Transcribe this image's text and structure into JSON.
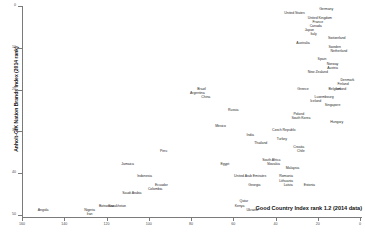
{
  "chart_data": {
    "type": "scatter",
    "title": "",
    "xlabel": "Good Country Index rank 1.2 (2014 data)",
    "ylabel": "Anholt-GfK Nation Brands Index (2014 rank)",
    "xlim": [
      160,
      0
    ],
    "ylim": [
      0,
      50
    ],
    "x_reversed": true,
    "y_reversed": true,
    "grid": false,
    "legend": "none",
    "xticks": [
      160,
      140,
      120,
      100,
      80,
      60,
      40,
      20,
      0
    ],
    "yticks": [
      0,
      10,
      20,
      30,
      40,
      50
    ],
    "point_style": "text-label-only",
    "points": [
      {
        "label": "Germany",
        "x": 16,
        "y": 1
      },
      {
        "label": "United States",
        "x": 31,
        "y": 2
      },
      {
        "label": "United Kingdom",
        "x": 19,
        "y": 3
      },
      {
        "label": "France",
        "x": 20,
        "y": 4
      },
      {
        "label": "Canada",
        "x": 21,
        "y": 5
      },
      {
        "label": "Japan",
        "x": 24,
        "y": 6
      },
      {
        "label": "Italy",
        "x": 22,
        "y": 7
      },
      {
        "label": "Switzerland",
        "x": 11,
        "y": 8
      },
      {
        "label": "Australia",
        "x": 27,
        "y": 9
      },
      {
        "label": "Sweden",
        "x": 12,
        "y": 10
      },
      {
        "label": "Netherland",
        "x": 10,
        "y": 11
      },
      {
        "label": "Spain",
        "x": 18,
        "y": 13
      },
      {
        "label": "Norway",
        "x": 13,
        "y": 14
      },
      {
        "label": "Austria",
        "x": 13,
        "y": 15
      },
      {
        "label": "New Zealand",
        "x": 20,
        "y": 16
      },
      {
        "label": "Denmark",
        "x": 6,
        "y": 18
      },
      {
        "label": "Finland",
        "x": 8,
        "y": 19
      },
      {
        "label": "Belgium",
        "x": 12,
        "y": 20
      },
      {
        "label": "Ireland",
        "x": 9,
        "y": 20
      },
      {
        "label": "Greece",
        "x": 27,
        "y": 20
      },
      {
        "label": "Luxembourg",
        "x": 17,
        "y": 22
      },
      {
        "label": "Iceland",
        "x": 21,
        "y": 23
      },
      {
        "label": "Singapore",
        "x": 13,
        "y": 24
      },
      {
        "label": "Poland",
        "x": 29,
        "y": 26
      },
      {
        "label": "South Korea",
        "x": 28,
        "y": 27
      },
      {
        "label": "Hungary",
        "x": 11,
        "y": 28
      },
      {
        "label": "Czech Republic",
        "x": 36,
        "y": 30
      },
      {
        "label": "Turkey",
        "x": 37,
        "y": 32
      },
      {
        "label": "Croatia",
        "x": 29,
        "y": 34
      },
      {
        "label": "Chile",
        "x": 28,
        "y": 35
      },
      {
        "label": "South Africa",
        "x": 42,
        "y": 37
      },
      {
        "label": "Slovakia",
        "x": 41,
        "y": 38
      },
      {
        "label": "Malaysia",
        "x": 32,
        "y": 39
      },
      {
        "label": "Romania",
        "x": 35,
        "y": 41
      },
      {
        "label": "Lithuania",
        "x": 35,
        "y": 42
      },
      {
        "label": "Latvia",
        "x": 34,
        "y": 43
      },
      {
        "label": "Estonia",
        "x": 24,
        "y": 43
      },
      {
        "label": "United Arab Emirates",
        "x": 52,
        "y": 41
      },
      {
        "label": "Georgia",
        "x": 50,
        "y": 43
      },
      {
        "label": "Qatar",
        "x": 55,
        "y": 47
      },
      {
        "label": "Kenya",
        "x": 57,
        "y": 48
      },
      {
        "label": "Ukraine",
        "x": 51,
        "y": 49
      },
      {
        "label": "Egypt",
        "x": 64,
        "y": 38
      },
      {
        "label": "Thailand",
        "x": 47,
        "y": 33
      },
      {
        "label": "India",
        "x": 52,
        "y": 31
      },
      {
        "label": "Russia",
        "x": 60,
        "y": 25
      },
      {
        "label": "Mexico",
        "x": 66,
        "y": 29
      },
      {
        "label": "China",
        "x": 73,
        "y": 22
      },
      {
        "label": "Argentina",
        "x": 77,
        "y": 21
      },
      {
        "label": "Brazil",
        "x": 75,
        "y": 20
      },
      {
        "label": "Peru",
        "x": 93,
        "y": 35
      },
      {
        "label": "Jamaica",
        "x": 110,
        "y": 38
      },
      {
        "label": "Indonesia",
        "x": 102,
        "y": 41
      },
      {
        "label": "Ecuador",
        "x": 94,
        "y": 43
      },
      {
        "label": "Colombia",
        "x": 97,
        "y": 44
      },
      {
        "label": "Saudi Arabia",
        "x": 108,
        "y": 45
      },
      {
        "label": "Botswana",
        "x": 120,
        "y": 48
      },
      {
        "label": "Kazakhstan",
        "x": 115,
        "y": 48
      },
      {
        "label": "Nigeria",
        "x": 128,
        "y": 49
      },
      {
        "label": "Iran",
        "x": 128,
        "y": 50
      },
      {
        "label": "Angola",
        "x": 150,
        "y": 49
      }
    ]
  }
}
